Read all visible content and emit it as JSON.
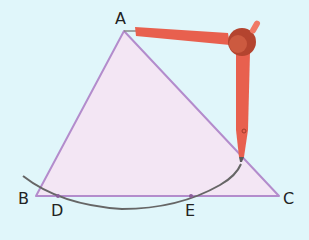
{
  "diagram": {
    "background": "#e0f6fa",
    "triangle": {
      "fill": "#f3e6f4",
      "stroke": "#b38ccc",
      "vertices": {
        "A": {
          "label": "A",
          "x": 124,
          "y": 31
        },
        "B": {
          "label": "B",
          "x": 36,
          "y": 196
        },
        "C": {
          "label": "C",
          "x": 279,
          "y": 196
        }
      }
    },
    "points": {
      "D": {
        "label": "D",
        "x": 58,
        "y": 196
      },
      "E": {
        "label": "E",
        "x": 191,
        "y": 196
      }
    },
    "arc": {
      "stroke": "#666666",
      "description": "arc centered at A intersecting BC at D and E"
    },
    "compass": {
      "color": "#e8604e",
      "head_color": "#b4442f",
      "needle_at": "A",
      "pencil_tip": {
        "x": 241,
        "y": 160
      }
    }
  }
}
